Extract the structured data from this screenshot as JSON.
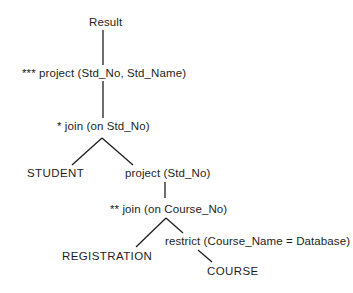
{
  "diagram": {
    "type": "query-tree",
    "nodes": {
      "result": {
        "label": "Result"
      },
      "project_outer": {
        "label": "*** project (Std_No, Std_Name)"
      },
      "join_std": {
        "label": "* join (on Std_No)"
      },
      "student": {
        "label": "STUDENT"
      },
      "project_inner": {
        "label": "project (Std_No)"
      },
      "join_course": {
        "label": "** join (on Course_No)"
      },
      "registration": {
        "label": "REGISTRATION"
      },
      "restrict": {
        "label": "restrict (Course_Name = Database)"
      },
      "course": {
        "label": "COURSE"
      }
    },
    "edges": [
      {
        "from": "result",
        "to": "project_outer"
      },
      {
        "from": "project_outer",
        "to": "join_std"
      },
      {
        "from": "join_std",
        "to": "student"
      },
      {
        "from": "join_std",
        "to": "project_inner"
      },
      {
        "from": "project_inner",
        "to": "join_course"
      },
      {
        "from": "join_course",
        "to": "registration"
      },
      {
        "from": "join_course",
        "to": "restrict"
      },
      {
        "from": "restrict",
        "to": "course"
      }
    ],
    "line_color": "#1e1e1e",
    "text_color": "#1e1e1e"
  }
}
